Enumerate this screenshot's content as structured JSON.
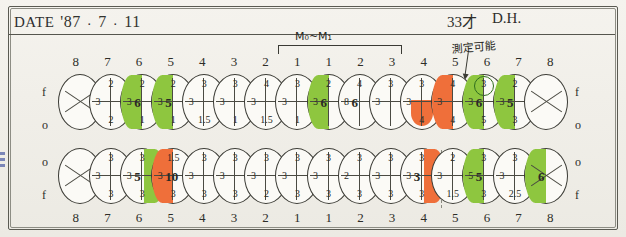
{
  "header": {
    "date_label": "DATE",
    "year": "'87",
    "dot1": "·",
    "month": "7",
    "dot2": "·",
    "day": "11",
    "age": "33才",
    "initials": "D.H.",
    "note_jp": "測定可能",
    "bracket_label": "M₀~M₁"
  },
  "labels": {
    "f": "f",
    "o": "o"
  },
  "upper_numbers": [
    "8",
    "7",
    "6",
    "5",
    "4",
    "3",
    "2",
    "1",
    "1",
    "2",
    "3",
    "4",
    "5",
    "6",
    "7",
    "8"
  ],
  "lower_numbers": [
    "8",
    "7",
    "6",
    "5",
    "4",
    "3",
    "2",
    "1",
    "1",
    "2",
    "3",
    "4",
    "5",
    "6",
    "7",
    "8"
  ],
  "upper_teeth": [
    {
      "id": "u8",
      "top": "",
      "bottom": "",
      "left": "",
      "right": "",
      "mid": "",
      "fill": "none",
      "cross": "x"
    },
    {
      "id": "u7",
      "top": "2",
      "bottom": "2",
      "left": "3",
      "right": "3",
      "mid": "",
      "fill": "none",
      "cross": "plus"
    },
    {
      "id": "u6",
      "top": "2",
      "bottom": "1",
      "left": "3",
      "right": "",
      "mid": "6",
      "fill": "left-green",
      "cross": "plus"
    },
    {
      "id": "u5",
      "top": "2",
      "bottom": "1",
      "left": "3",
      "right": "3",
      "mid": "5",
      "fill": "left-green",
      "cross": "plus"
    },
    {
      "id": "u4",
      "top": "3",
      "bottom": "1.5",
      "left": "3",
      "right": "3",
      "mid": "",
      "fill": "none",
      "cross": "plus"
    },
    {
      "id": "u3",
      "top": "3",
      "bottom": "1",
      "left": "3",
      "right": "3",
      "mid": "",
      "fill": "none",
      "cross": "plus"
    },
    {
      "id": "u2",
      "top": "4",
      "bottom": "1.5",
      "left": "3",
      "right": "2",
      "mid": "",
      "fill": "none",
      "cross": "plus"
    },
    {
      "id": "u1",
      "top": "3",
      "bottom": "1",
      "left": "3",
      "right": "3",
      "mid": "",
      "fill": "none",
      "cross": "plus"
    },
    {
      "id": "u1r",
      "top": "2",
      "bottom": "",
      "left": "3",
      "right": "",
      "mid": "6",
      "fill": "left-green",
      "cross": "plus"
    },
    {
      "id": "u2r",
      "top": "4",
      "bottom": "",
      "left": "8",
      "right": "",
      "mid": "6",
      "fill": "none",
      "cross": "plus"
    },
    {
      "id": "u3r",
      "top": "3",
      "bottom": "",
      "left": "3",
      "right": "3",
      "mid": "",
      "fill": "none",
      "cross": "plus"
    },
    {
      "id": "u4r",
      "top": "3",
      "bottom": "4",
      "left": "3",
      "right": "",
      "mid": "",
      "fill": "orange-bottom",
      "cross": "plus"
    },
    {
      "id": "u5r",
      "top": "4",
      "bottom": "4",
      "left": "3",
      "right": "",
      "mid": "",
      "fill": "left-orange",
      "cross": "plus"
    },
    {
      "id": "u6r",
      "top": "3",
      "bottom": "5",
      "left": "3",
      "right": "",
      "mid": "6",
      "fill": "green-circle",
      "cross": "plus"
    },
    {
      "id": "u7r",
      "top": "2",
      "bottom": "3",
      "left": "3",
      "right": "4",
      "mid": "5",
      "fill": "left-green",
      "cross": "plus"
    },
    {
      "id": "u8r",
      "top": "",
      "bottom": "",
      "left": "",
      "right": "",
      "mid": "",
      "fill": "none",
      "cross": "x"
    }
  ],
  "lower_teeth": [
    {
      "id": "l8",
      "top": "",
      "bottom": "",
      "left": "",
      "right": "",
      "mid": "",
      "fill": "none",
      "cross": "x"
    },
    {
      "id": "l7",
      "top": "3",
      "bottom": "3",
      "left": "3",
      "right": "3",
      "mid": "",
      "fill": "none",
      "cross": "plus"
    },
    {
      "id": "l6",
      "top": "3",
      "bottom": "3",
      "left": "3",
      "right": "",
      "mid": "5",
      "fill": "right-green",
      "cross": "plus"
    },
    {
      "id": "l5",
      "top": "1.5",
      "bottom": "3",
      "left": "3",
      "right": "3",
      "mid": "10",
      "fill": "left-orange",
      "cross": "plus"
    },
    {
      "id": "l4",
      "top": "3",
      "bottom": "3",
      "left": "3",
      "right": "3",
      "mid": "",
      "fill": "none",
      "cross": "plus"
    },
    {
      "id": "l3",
      "top": "3",
      "bottom": "3",
      "left": "3",
      "right": "3",
      "mid": "",
      "fill": "none",
      "cross": "plus"
    },
    {
      "id": "l2",
      "top": "3",
      "bottom": "2",
      "left": "3",
      "right": "3",
      "mid": "",
      "fill": "none",
      "cross": "plus"
    },
    {
      "id": "l1",
      "top": "3",
      "bottom": "3",
      "left": "3",
      "right": "3",
      "mid": "",
      "fill": "none",
      "cross": "plus"
    },
    {
      "id": "l1r",
      "top": "3",
      "bottom": "3",
      "left": "3",
      "right": "3",
      "mid": "",
      "fill": "none",
      "cross": "plus"
    },
    {
      "id": "l2r",
      "top": "3",
      "bottom": "3",
      "left": "2",
      "right": "2",
      "mid": "",
      "fill": "none",
      "cross": "plus"
    },
    {
      "id": "l3r",
      "top": "3",
      "bottom": "3",
      "left": "3",
      "right": "3",
      "mid": "",
      "fill": "none",
      "cross": "plus"
    },
    {
      "id": "l4r",
      "top": "3",
      "bottom": "3",
      "left": "3",
      "right": "",
      "mid": "3",
      "fill": "right-orange",
      "cross": "plus"
    },
    {
      "id": "l5r",
      "top": "2",
      "bottom": "1.5",
      "left": "3",
      "right": "3",
      "mid": "",
      "fill": "none",
      "cross": "plus"
    },
    {
      "id": "l6r",
      "top": "3",
      "bottom": "3",
      "left": "5",
      "right": "",
      "mid": "5",
      "fill": "left-green",
      "cross": "plus"
    },
    {
      "id": "l7r",
      "top": "3",
      "bottom": "2.5",
      "left": "3",
      "right": "1",
      "mid": "",
      "fill": "none",
      "cross": "plus"
    },
    {
      "id": "l8r",
      "top": "",
      "bottom": "",
      "left": "",
      "right": "",
      "mid": "6",
      "fill": "left-green",
      "cross": "x"
    }
  ]
}
